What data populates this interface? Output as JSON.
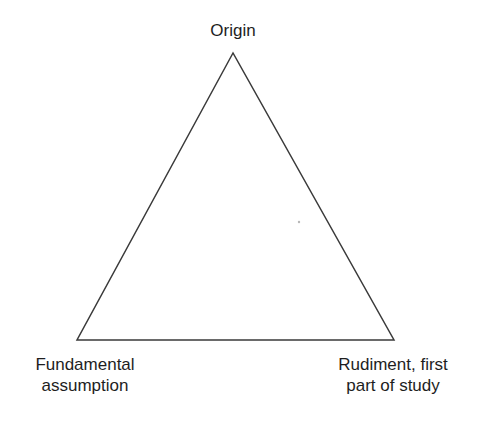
{
  "diagram": {
    "type": "triangle",
    "vertices": {
      "top": {
        "label": "Origin"
      },
      "bottom_left": {
        "label_line1": "Fundamental",
        "label_line2": "assumption"
      },
      "bottom_right": {
        "label_line1": "Rudiment, first",
        "label_line2": "part of study"
      }
    },
    "stroke_color": "#3a3a3a",
    "text_color": "#1e1e1e"
  }
}
